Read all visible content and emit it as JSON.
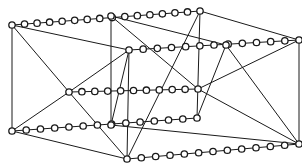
{
  "diagram": {
    "type": "graph",
    "colors": {
      "stroke": "#1a1a1a",
      "background": "#ffffff",
      "node_fill": "#ffffff"
    },
    "node_radius": 3.2,
    "hubs": {
      "A": [
        12,
        25
      ],
      "B": [
        111,
        16
      ],
      "C": [
        200,
        11
      ],
      "D": [
        129,
        50
      ],
      "E": [
        226,
        45
      ],
      "F": [
        299,
        40
      ],
      "G": [
        69,
        92
      ],
      "H": [
        198,
        89
      ],
      "J": [
        111,
        125
      ],
      "I": [
        12,
        131
      ],
      "K": [
        197,
        118
      ],
      "L": [
        127,
        159
      ],
      "M": [
        299,
        144
      ]
    },
    "chains": [
      {
        "from": "A",
        "to": "C",
        "beads": 15
      },
      {
        "from": "D",
        "to": "F",
        "beads": 12
      },
      {
        "from": "G",
        "to": "H",
        "beads": 10
      },
      {
        "from": "I",
        "to": "K",
        "beads": 13
      },
      {
        "from": "L",
        "to": "M",
        "beads": 12
      }
    ],
    "edges": [
      [
        "A",
        "I"
      ],
      [
        "A",
        "D"
      ],
      [
        "A",
        "G"
      ],
      [
        "B",
        "J"
      ],
      [
        "B",
        "E"
      ],
      [
        "B",
        "H"
      ],
      [
        "C",
        "F"
      ],
      [
        "C",
        "L"
      ],
      [
        "C",
        "K"
      ],
      [
        "D",
        "L"
      ],
      [
        "D",
        "G"
      ],
      [
        "E",
        "M"
      ],
      [
        "E",
        "K"
      ],
      [
        "F",
        "M"
      ],
      [
        "F",
        "H"
      ],
      [
        "G",
        "I"
      ],
      [
        "G",
        "L"
      ],
      [
        "H",
        "M"
      ],
      [
        "I",
        "L"
      ],
      [
        "J",
        "M"
      ],
      [
        "D",
        "J"
      ]
    ]
  }
}
